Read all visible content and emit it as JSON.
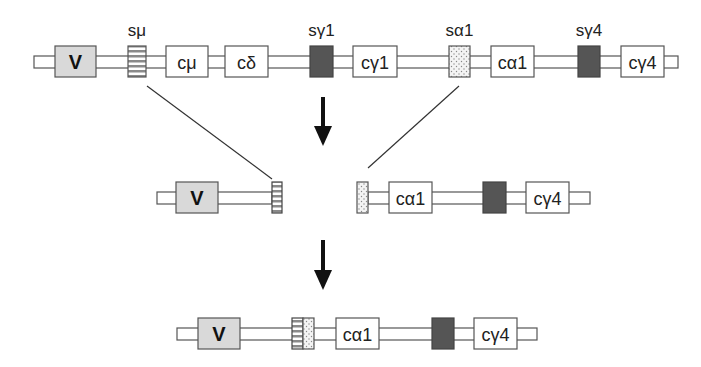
{
  "diagram": {
    "colors": {
      "line": "#555555",
      "v_fill": "#d9d9d9",
      "box_fill": "#ffffff",
      "switch_dark": "#555555",
      "switch_striped": "#8a8a8a",
      "switch_dotted_bg": "#f2f2f2",
      "arrow": "#111111"
    },
    "row1": {
      "labels": {
        "s_mu": "sμ",
        "s_gamma1": "sγ1",
        "s_alpha1": "sα1",
        "s_gamma4": "sγ4"
      },
      "segments": {
        "v": "V",
        "c_mu": "cμ",
        "c_delta": "cδ",
        "c_gamma1": "cγ1",
        "c_alpha1": "cα1",
        "c_gamma4": "cγ4"
      }
    },
    "row2": {
      "segments": {
        "v": "V",
        "c_alpha1": "cα1",
        "c_gamma4": "cγ4"
      }
    },
    "row3": {
      "segments": {
        "v": "V",
        "c_alpha1": "cα1",
        "c_gamma4": "cγ4"
      }
    }
  }
}
